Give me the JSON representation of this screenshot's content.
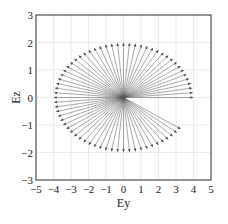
{
  "chart_data": {
    "type": "quiver",
    "title": "",
    "xlabel": "Ey",
    "ylabel": "Ez",
    "xlim": [
      -5,
      5
    ],
    "ylim": [
      -3,
      3
    ],
    "xticks": [
      -5,
      -4,
      -3,
      -2,
      -1,
      0,
      1,
      2,
      3,
      4,
      5
    ],
    "yticks": [
      -3,
      -2,
      -1,
      0,
      1,
      2,
      3
    ],
    "grid": true,
    "legend": null,
    "series": [
      {
        "name": "E vectors",
        "origin": [
          0,
          0
        ],
        "description": "Arrows from origin to points on ellipse Ey=4cos(theta), Ez=2sin(theta)",
        "amplitude_y": 4,
        "amplitude_z": 2,
        "theta_start_deg": 0,
        "theta_end_deg": 327,
        "theta_step_deg": 5,
        "color": "#555555"
      }
    ]
  },
  "axes": {
    "xlabel": "Ey",
    "ylabel": "Ez"
  }
}
